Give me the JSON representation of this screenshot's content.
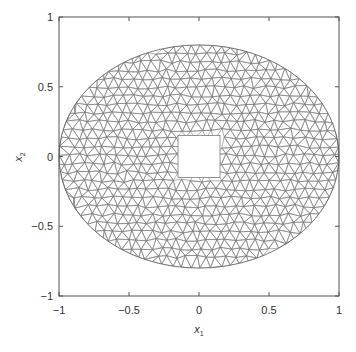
{
  "chart_data": {
    "type": "mesh",
    "title": "",
    "xlabel": "x1",
    "ylabel": "x2",
    "xlim": [
      -1,
      1
    ],
    "ylim": [
      -1,
      1
    ],
    "xticks": [
      -1,
      -0.5,
      0,
      0.5,
      1
    ],
    "yticks": [
      -1,
      -0.5,
      0,
      0.5,
      1
    ],
    "xtick_labels": [
      "−1",
      "−0.5",
      "0",
      "0.5",
      "1"
    ],
    "ytick_labels": [
      "−1",
      "−0.5",
      "0",
      "0.5",
      "1"
    ],
    "grid": false,
    "domain": {
      "outer_boundary": {
        "shape": "ellipse",
        "center": [
          0,
          0
        ],
        "semi_axis_x": 1.0,
        "semi_axis_y": 0.8
      },
      "hole": {
        "shape": "square",
        "center": [
          0,
          0
        ],
        "half_width": 0.15
      }
    },
    "mesh": {
      "element": "triangle",
      "approx_edge_length": 0.07,
      "line_color": "#7a7a7a"
    }
  },
  "axes": {
    "xlabel_main": "x",
    "xlabel_sub": "1",
    "ylabel_main": "x",
    "ylabel_sub": "2",
    "frame_color": "#555555"
  }
}
